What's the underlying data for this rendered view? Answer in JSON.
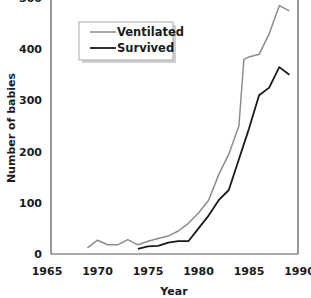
{
  "chart_data": {
    "type": "line",
    "title": "",
    "xlabel": "Year",
    "ylabel": "Number of babies",
    "xlim": [
      1965,
      1990
    ],
    "ylim": [
      0,
      500
    ],
    "x_ticks": [
      1965,
      1970,
      1975,
      1980,
      1985,
      1990
    ],
    "y_ticks": [
      0,
      100,
      200,
      300,
      400,
      500
    ],
    "grid": false,
    "legend_position": "upper-left (inside)",
    "series": [
      {
        "name": "Ventilated",
        "color": "#8c8c8c",
        "x": [
          1969,
          1970,
          1971,
          1972,
          1973,
          1974,
          1975,
          1976,
          1977,
          1978,
          1979,
          1980,
          1981,
          1982,
          1983,
          1984,
          1984.5,
          1985,
          1986,
          1986.5,
          1987,
          1988,
          1989
        ],
        "values": [
          12,
          27,
          18,
          18,
          28,
          18,
          25,
          30,
          35,
          45,
          60,
          80,
          105,
          155,
          195,
          250,
          380,
          385,
          390,
          410,
          430,
          485,
          475
        ]
      },
      {
        "name": "Survived",
        "color": "#1a1a1a",
        "x": [
          1974,
          1975,
          1976,
          1977,
          1978,
          1979,
          1980,
          1981,
          1982,
          1983,
          1984,
          1985,
          1986,
          1987,
          1988,
          1989
        ],
        "values": [
          10,
          15,
          16,
          22,
          25,
          25,
          50,
          75,
          105,
          125,
          185,
          245,
          310,
          325,
          365,
          350
        ]
      }
    ]
  },
  "legend": {
    "items": [
      {
        "label": "Ventilated"
      },
      {
        "label": "Survived"
      }
    ]
  },
  "axes": {
    "x_title": "Year",
    "y_title": "Number of babies",
    "x_tick_labels": [
      "1965",
      "1970",
      "1975",
      "1980",
      "1985",
      "1990"
    ],
    "y_tick_labels": [
      "0",
      "100",
      "200",
      "300",
      "400",
      "500"
    ]
  }
}
